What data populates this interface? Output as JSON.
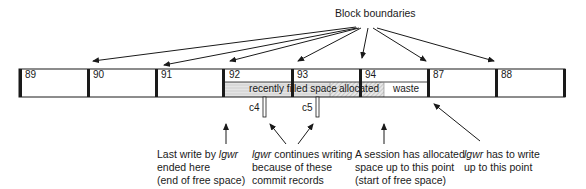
{
  "title": "Block boundaries",
  "blocks": [
    {
      "label": "89"
    },
    {
      "label": "90"
    },
    {
      "label": "91"
    },
    {
      "label": "92"
    },
    {
      "label": "93"
    },
    {
      "label": "94"
    },
    {
      "label": "87"
    },
    {
      "label": "88"
    }
  ],
  "segments": {
    "recent": "recently filled space",
    "allocated": "allocated",
    "waste": "waste"
  },
  "commits": {
    "c4": "c4",
    "c5": "c5"
  },
  "annotations": {
    "last_write": {
      "l1a": "Last write by ",
      "l1b": "lgwr",
      "l2": "ended here",
      "l3": "(end of free space)"
    },
    "continues": {
      "l1a": "lgwr",
      "l1b": " continues writing",
      "l2": "because of these",
      "l3": "commit records"
    },
    "session": {
      "l1": "A session has allocated",
      "l2": "space up to this point",
      "l3": "(start of free space)"
    },
    "has_to": {
      "l1a": "lgwr",
      "l1b": " has to write",
      "l2": "up to this point"
    }
  },
  "colors": {
    "line": "#1a1a1a",
    "hatch_light": "#d9d9d9",
    "hatch_dark": "#bfbfbf"
  }
}
